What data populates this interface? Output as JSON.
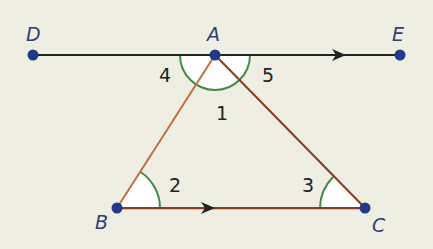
{
  "diagram": {
    "type": "geometry",
    "colors": {
      "background": "#efeee2",
      "point": "#1f3a8a",
      "line_de": "#222222",
      "triangle_side": "#b5632e",
      "base_bc": "#8a3a1e",
      "angle_arc": "#3f8a4a",
      "angle_fill": "#ffffff"
    },
    "points": [
      {
        "name": "D",
        "x": 33,
        "y": 55
      },
      {
        "name": "A",
        "x": 215,
        "y": 55
      },
      {
        "name": "E",
        "x": 400,
        "y": 55
      },
      {
        "name": "B",
        "x": 117,
        "y": 208
      },
      {
        "name": "C",
        "x": 365,
        "y": 208
      }
    ],
    "point_labels": {
      "D": "D",
      "A": "A",
      "E": "E",
      "B": "B",
      "C": "C"
    },
    "angles": [
      {
        "label": "1",
        "vertex": "A",
        "between": [
          "B",
          "C"
        ]
      },
      {
        "label": "2",
        "vertex": "B",
        "between": [
          "A",
          "C"
        ]
      },
      {
        "label": "3",
        "vertex": "C",
        "between": [
          "A",
          "B"
        ]
      },
      {
        "label": "4",
        "vertex": "A",
        "between": [
          "D",
          "B"
        ]
      },
      {
        "label": "5",
        "vertex": "A",
        "between": [
          "E",
          "C"
        ]
      }
    ],
    "angle_labels": {
      "a1": "1",
      "a2": "2",
      "a3": "3",
      "a4": "4",
      "a5": "5"
    },
    "parallel_marks": [
      "DE",
      "BC"
    ]
  }
}
